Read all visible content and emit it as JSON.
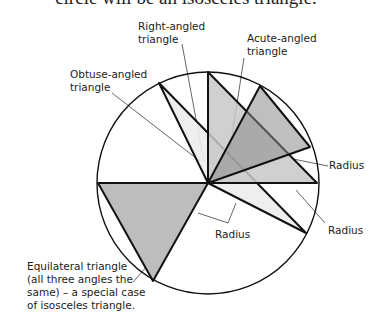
{
  "caption": "circle will be an isosceles triangle.",
  "labels": {
    "right": "Right-angled\ntriangle",
    "acute": "Acute-angled\ntriangle",
    "obtuse": "Obtuse-angled\ntriangle",
    "radius1": "Radius",
    "radius2": "Radius",
    "radius3": "Radius",
    "equilateral": "Equilateral triangle\n(all three angles the\nsame) – a special case\nof isosceles triangle."
  },
  "colors": {
    "stroke": "#111111",
    "light_fill": "#e8e8e8",
    "mid_fill": "#c4c4c4",
    "dark_fill": "#8c8c8c",
    "leader": "#555555"
  },
  "geometry": {
    "circle": {
      "cx": 208,
      "cy": 183,
      "r": 111
    },
    "triangles": {
      "obtuse": [
        [
          159,
          83
        ],
        [
          208,
          183
        ],
        [
          306,
          233
        ]
      ],
      "right": [
        [
          208,
          72
        ],
        [
          208,
          183
        ],
        [
          317,
          183
        ]
      ],
      "acute": [
        [
          260,
          86
        ],
        [
          310,
          147
        ],
        [
          208,
          183
        ]
      ],
      "equilateral": [
        [
          98,
          183
        ],
        [
          208,
          183
        ],
        [
          153,
          281
        ]
      ]
    }
  }
}
